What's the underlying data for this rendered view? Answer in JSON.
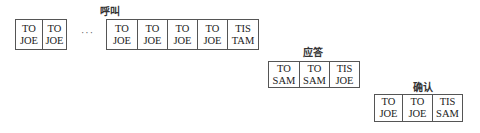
{
  "diagram": {
    "groups": [
      {
        "label": "",
        "cells": [
          {
            "line1": "TO",
            "line2": "JOE"
          },
          {
            "line1": "TO",
            "line2": "JOE"
          }
        ]
      },
      {
        "label": "呼叫",
        "cells": [
          {
            "line1": "TO",
            "line2": "JOE"
          },
          {
            "line1": "TO",
            "line2": "JOE"
          },
          {
            "line1": "TO",
            "line2": "JOE"
          },
          {
            "line1": "TO",
            "line2": "JOE"
          },
          {
            "line1": "TIS",
            "line2": "TAM"
          }
        ]
      },
      {
        "label": "应答",
        "cells": [
          {
            "line1": "TO",
            "line2": "SAM"
          },
          {
            "line1": "TO",
            "line2": "SAM"
          },
          {
            "line1": "TIS",
            "line2": "JOE"
          }
        ]
      },
      {
        "label": "确认",
        "cells": [
          {
            "line1": "TO",
            "line2": "JOE"
          },
          {
            "line1": "TO",
            "line2": "JOE"
          },
          {
            "line1": "TIS",
            "line2": "SAM"
          }
        ]
      }
    ],
    "ellipsis": "···"
  }
}
